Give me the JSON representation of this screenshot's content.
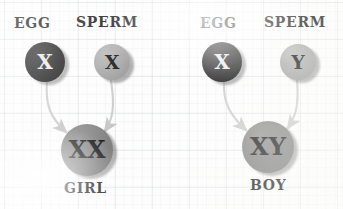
{
  "diagram": {
    "background": {
      "style": "graph-paper",
      "paper_color": "#fdfdfd",
      "grid_color": "#bcc4c8"
    },
    "colors": {
      "egg_cell": "#141414",
      "sperm_cell": "#a2a2a2",
      "offspring_cell": "#7d7d7d",
      "arrow": "#c9c9c9",
      "text": "#101010"
    },
    "crosses": [
      {
        "id": "girl-cross",
        "parents": [
          {
            "role": "egg",
            "label": "EGG",
            "chromosome": "X",
            "fill": "egg_cell",
            "cx": 45,
            "cy": 62,
            "r": 20
          },
          {
            "role": "sperm",
            "label": "SPERM",
            "chromosome": "X",
            "fill": "sperm_cell",
            "cx": 112,
            "cy": 62,
            "r": 18
          }
        ],
        "offspring": {
          "label": "GIRL",
          "chromosome": "XX",
          "fill": "offspring_cell",
          "cx": 87,
          "cy": 150,
          "r": 26
        }
      },
      {
        "id": "boy-cross",
        "parents": [
          {
            "role": "egg",
            "label": "EGG",
            "chromosome": "X",
            "fill": "egg_cell",
            "cx": 222,
            "cy": 62,
            "r": 20
          },
          {
            "role": "sperm",
            "label": "SPERM",
            "chromosome": "Y",
            "fill": "sperm_cell",
            "cx": 298,
            "cy": 62,
            "r": 18
          }
        ],
        "offspring": {
          "label": "BOY",
          "chromosome": "XY",
          "fill": "offspring_cell",
          "cx": 268,
          "cy": 147,
          "r": 26
        }
      }
    ],
    "labels": {
      "girl_egg": "EGG",
      "girl_sperm": "SPERM",
      "girl_egg_chromosome": "X",
      "girl_sperm_chromosome": "X",
      "girl_offspring_chromosome": "XX",
      "girl_offspring": "GIRL",
      "boy_egg": "EGG",
      "boy_sperm": "SPERM",
      "boy_egg_chromosome": "X",
      "boy_sperm_chromosome": "Y",
      "boy_offspring_chromosome": "XY",
      "boy_offspring": "BOY"
    }
  }
}
